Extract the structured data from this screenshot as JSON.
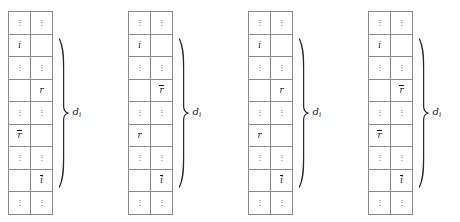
{
  "figure": {
    "columns_per_matrix": 2,
    "rows_per_matrix": 9,
    "dots_glyph": "⋮",
    "line_color": "#8a8a8a",
    "text_color": "#141414",
    "brace_color": "#2b2b2b"
  },
  "blocks": [
    {
      "id": "block-1",
      "label": "d",
      "label_subscript": "i",
      "rows": [
        {
          "left": "⋮",
          "right": "⋮",
          "type": "dots"
        },
        {
          "left": "i",
          "right": "",
          "type": "symbol",
          "left_bar": false,
          "right_bar": false
        },
        {
          "left": "⋮",
          "right": "⋮",
          "type": "dots"
        },
        {
          "left": "",
          "right": "r",
          "type": "symbol",
          "left_bar": false,
          "right_bar": false
        },
        {
          "left": "⋮",
          "right": "⋮",
          "type": "dots"
        },
        {
          "left": "r",
          "right": "",
          "type": "symbol",
          "left_bar": true,
          "right_bar": false
        },
        {
          "left": "⋮",
          "right": "⋮",
          "type": "dots"
        },
        {
          "left": "",
          "right": "i",
          "type": "symbol",
          "left_bar": false,
          "right_bar": true
        },
        {
          "left": "⋮",
          "right": "⋮",
          "type": "dots"
        }
      ]
    },
    {
      "id": "block-2",
      "label": "d",
      "label_subscript": "i",
      "rows": [
        {
          "left": "⋮",
          "right": "⋮",
          "type": "dots"
        },
        {
          "left": "i",
          "right": "",
          "type": "symbol",
          "left_bar": false,
          "right_bar": false
        },
        {
          "left": "⋮",
          "right": "⋮",
          "type": "dots"
        },
        {
          "left": "",
          "right": "r",
          "type": "symbol",
          "left_bar": false,
          "right_bar": true
        },
        {
          "left": "⋮",
          "right": "⋮",
          "type": "dots"
        },
        {
          "left": "r",
          "right": "",
          "type": "symbol",
          "left_bar": false,
          "right_bar": false
        },
        {
          "left": "⋮",
          "right": "⋮",
          "type": "dots"
        },
        {
          "left": "",
          "right": "i",
          "type": "symbol",
          "left_bar": false,
          "right_bar": true
        },
        {
          "left": "⋮",
          "right": "⋮",
          "type": "dots"
        }
      ]
    },
    {
      "id": "block-3",
      "label": "d",
      "label_subscript": "i",
      "rows": [
        {
          "left": "⋮",
          "right": "⋮",
          "type": "dots"
        },
        {
          "left": "i",
          "right": "",
          "type": "symbol",
          "left_bar": false,
          "right_bar": false
        },
        {
          "left": "⋮",
          "right": "⋮",
          "type": "dots"
        },
        {
          "left": "",
          "right": "r",
          "type": "symbol",
          "left_bar": false,
          "right_bar": false
        },
        {
          "left": "⋮",
          "right": "⋮",
          "type": "dots"
        },
        {
          "left": "r",
          "right": "",
          "type": "symbol",
          "left_bar": false,
          "right_bar": false
        },
        {
          "left": "⋮",
          "right": "⋮",
          "type": "dots"
        },
        {
          "left": "",
          "right": "i",
          "type": "symbol",
          "left_bar": false,
          "right_bar": true
        },
        {
          "left": "⋮",
          "right": "⋮",
          "type": "dots"
        }
      ]
    },
    {
      "id": "block-4",
      "label": "d",
      "label_subscript": "i",
      "rows": [
        {
          "left": "⋮",
          "right": "⋮",
          "type": "dots"
        },
        {
          "left": "i",
          "right": "",
          "type": "symbol",
          "left_bar": false,
          "right_bar": false
        },
        {
          "left": "⋮",
          "right": "⋮",
          "type": "dots"
        },
        {
          "left": "",
          "right": "r",
          "type": "symbol",
          "left_bar": false,
          "right_bar": true
        },
        {
          "left": "⋮",
          "right": "⋮",
          "type": "dots"
        },
        {
          "left": "r",
          "right": "",
          "type": "symbol",
          "left_bar": true,
          "right_bar": false
        },
        {
          "left": "⋮",
          "right": "⋮",
          "type": "dots"
        },
        {
          "left": "",
          "right": "i",
          "type": "symbol",
          "left_bar": false,
          "right_bar": true
        },
        {
          "left": "⋮",
          "right": "⋮",
          "type": "dots"
        }
      ]
    }
  ],
  "layout": {
    "block_offsets": [
      8,
      128,
      248,
      368
    ],
    "matrix_top": 11
  }
}
